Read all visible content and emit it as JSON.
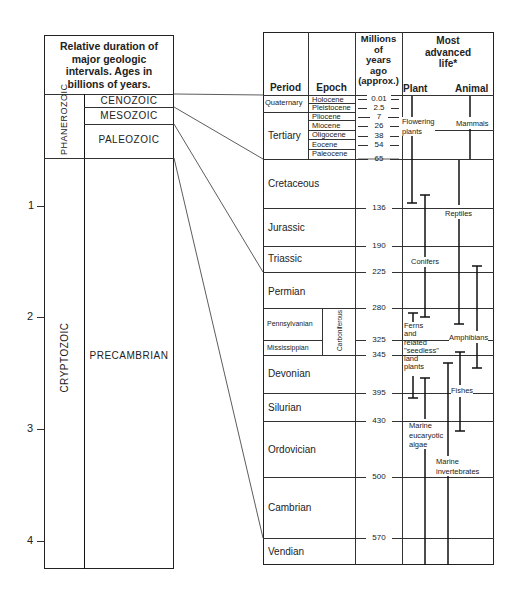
{
  "left_panel": {
    "header": "Relative duration of major geologic intervals. Ages in billions of years.",
    "header_lines": [
      "Relative duration of",
      "major geologic",
      "intervals. Ages in",
      "billions of years."
    ],
    "eons": [
      {
        "name": "PHANEROZOIC"
      },
      {
        "name": "CRYPTOZOIC"
      }
    ],
    "eras": [
      {
        "name": "CENOZOIC"
      },
      {
        "name": "MESOZOIC"
      },
      {
        "name": "PALEOZOIC"
      },
      {
        "name": "PRECAMBRIAN"
      }
    ],
    "axis_ticks": [
      "1",
      "2",
      "3",
      "4"
    ]
  },
  "right_panel": {
    "headers": {
      "period": "Period",
      "epoch": "Epoch",
      "ma_lines": [
        "Millions",
        "of",
        "years",
        "ago",
        "(approx.)"
      ],
      "life_lines": [
        "Most",
        "advanced",
        "life*"
      ],
      "plant": "Plant",
      "animal": "Animal"
    },
    "periods": [
      {
        "name": "Quaternary"
      },
      {
        "name": "Tertiary"
      },
      {
        "name": "Cretaceous"
      },
      {
        "name": "Jurassic"
      },
      {
        "name": "Triassic"
      },
      {
        "name": "Permian"
      },
      {
        "name": "Pennsylvanian"
      },
      {
        "name": "Mississippian"
      },
      {
        "name": "Devonian"
      },
      {
        "name": "Silurian"
      },
      {
        "name": "Ordovician"
      },
      {
        "name": "Cambrian"
      },
      {
        "name": "Vendian"
      }
    ],
    "carboniferous": "Carboniferous",
    "epochs": [
      {
        "name": "Holocene"
      },
      {
        "name": "Pleistocene"
      },
      {
        "name": "Pliocene"
      },
      {
        "name": "Miocene"
      },
      {
        "name": "Oligocene"
      },
      {
        "name": "Eocene"
      },
      {
        "name": "Paleocene"
      }
    ],
    "ages_ma": [
      "0.01",
      "2.5",
      "7",
      "26",
      "38",
      "54",
      "65",
      "136",
      "190",
      "225",
      "280",
      "325",
      "345",
      "395",
      "430",
      "500",
      "570"
    ],
    "life": {
      "plants": [
        {
          "label": "Flowering plants",
          "lines": [
            "Flowering",
            "plants"
          ]
        },
        {
          "label": "Conifers",
          "lines": [
            "Conifers"
          ]
        },
        {
          "label": "Ferns and related \"seedless\" land plants",
          "lines": [
            "Ferns",
            "and",
            "related",
            "\"seedless\"",
            "land",
            "plants"
          ]
        },
        {
          "label": "Marine eucaryotic algae",
          "lines": [
            "Marine",
            "eucaryotic",
            "algae"
          ]
        }
      ],
      "animals": [
        {
          "label": "Mammals",
          "lines": [
            "Mammals"
          ]
        },
        {
          "label": "Reptiles",
          "lines": [
            "Reptiles"
          ]
        },
        {
          "label": "Amphibians",
          "lines": [
            "Amphibians"
          ]
        },
        {
          "label": "Fishes",
          "lines": [
            "Fishes"
          ]
        },
        {
          "label": "Marine invertebrates",
          "lines": [
            "Marine",
            "invertebrates"
          ]
        }
      ]
    }
  },
  "colors": {
    "ink": "#222222",
    "background": "#ffffff"
  }
}
